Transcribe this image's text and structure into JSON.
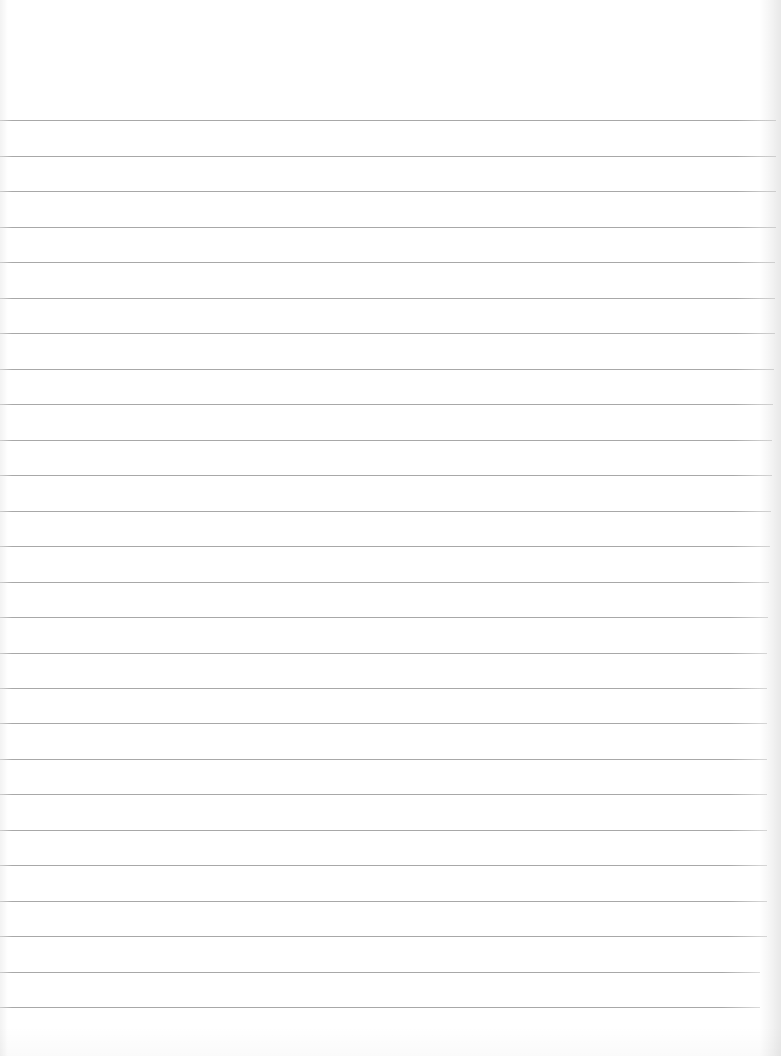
{
  "notepad": {
    "background_color": "#ffffff",
    "rule_color": "#a8a8a8",
    "rule_spacing_px": 35.5,
    "rules": [
      {
        "y": 120,
        "w": 776
      },
      {
        "y": 156,
        "w": 776
      },
      {
        "y": 191,
        "w": 776
      },
      {
        "y": 227,
        "w": 776
      },
      {
        "y": 262,
        "w": 775
      },
      {
        "y": 298,
        "w": 775
      },
      {
        "y": 333,
        "w": 775
      },
      {
        "y": 369,
        "w": 774
      },
      {
        "y": 404,
        "w": 773
      },
      {
        "y": 440,
        "w": 772
      },
      {
        "y": 475,
        "w": 772
      },
      {
        "y": 511,
        "w": 771
      },
      {
        "y": 546,
        "w": 770
      },
      {
        "y": 582,
        "w": 769
      },
      {
        "y": 617,
        "w": 768
      },
      {
        "y": 653,
        "w": 767
      },
      {
        "y": 688,
        "w": 767
      },
      {
        "y": 723,
        "w": 767
      },
      {
        "y": 759,
        "w": 767
      },
      {
        "y": 794,
        "w": 767
      },
      {
        "y": 830,
        "w": 767
      },
      {
        "y": 865,
        "w": 767
      },
      {
        "y": 901,
        "w": 767
      },
      {
        "y": 936,
        "w": 767
      },
      {
        "y": 972,
        "w": 760
      },
      {
        "y": 1007,
        "w": 760
      }
    ],
    "text": ""
  }
}
